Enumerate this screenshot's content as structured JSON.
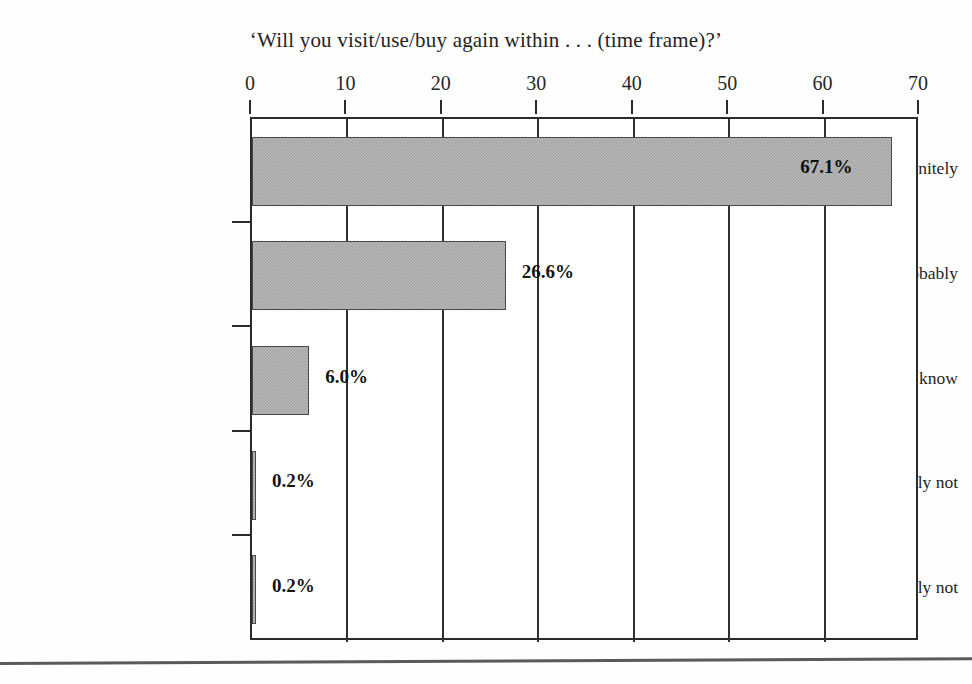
{
  "chart_data": {
    "type": "bar",
    "orientation": "horizontal",
    "title": "‘Will you visit/use/buy again within . . . (time frame)?’",
    "xlabel": "",
    "ylabel": "",
    "categories": [
      "Definitely",
      "Probably",
      "Not sure/don’t know",
      "Probably not",
      "Definitely not"
    ],
    "values": [
      67.1,
      26.6,
      6.0,
      0.2,
      0.2
    ],
    "value_labels": [
      "67.1%",
      "26.6%",
      "6.0%",
      "0.2%",
      "0.2%"
    ],
    "label_placement": [
      "inside",
      "outside",
      "outside",
      "outside",
      "outside"
    ],
    "xlim": [
      0,
      70
    ],
    "xticks": [
      0,
      10,
      20,
      30,
      40,
      50,
      60,
      70
    ],
    "xtick_labels": [
      "0",
      "10",
      "20",
      "30",
      "40",
      "50",
      "60",
      "70"
    ],
    "x_axis_position": "top",
    "grid": true,
    "grid_axis": "x",
    "legend": false,
    "units": "percent",
    "bar_fill": "#b9b9b9",
    "bar_edge": "#4a4a4a",
    "axis_color": "#2b2b2b",
    "background": "#ffffff"
  }
}
